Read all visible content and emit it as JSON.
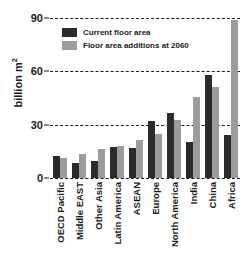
{
  "chart_data": {
    "type": "bar",
    "title": "",
    "xlabel": "",
    "ylabel": "billion m",
    "ylabel_exponent": "2",
    "ylim": [
      0,
      90
    ],
    "yticks": [
      0,
      30,
      60,
      90
    ],
    "grid": true,
    "legend_position": "top-left",
    "categories": [
      "OECD Pacific",
      "Middle EAST",
      "Other Asia",
      "Latin America",
      "ASEAN",
      "Europe",
      "North America",
      "India",
      "China",
      "Africa"
    ],
    "series": [
      {
        "name": "Current floor area",
        "color": "#2b2b2b",
        "values": [
          12.4,
          8.4,
          9.6,
          17.5,
          17.0,
          32.3,
          36.5,
          20.0,
          58.0,
          24.0
        ]
      },
      {
        "name": "Floor area additions at 2060",
        "color": "#9c9c9c",
        "values": [
          11.3,
          13.5,
          16.3,
          18.0,
          21.5,
          24.5,
          32.5,
          45.5,
          51.0,
          89.0
        ]
      }
    ]
  },
  "legend": {
    "items": [
      {
        "label": "Current floor area",
        "color": "#2b2b2b"
      },
      {
        "label": "Floor area additions at 2060",
        "color": "#9c9c9c"
      }
    ]
  },
  "axis": {
    "y_title_text": "billion m",
    "y_title_sup": "2",
    "tick_0": "0",
    "tick_30": "30",
    "tick_60": "60",
    "tick_90": "90"
  }
}
